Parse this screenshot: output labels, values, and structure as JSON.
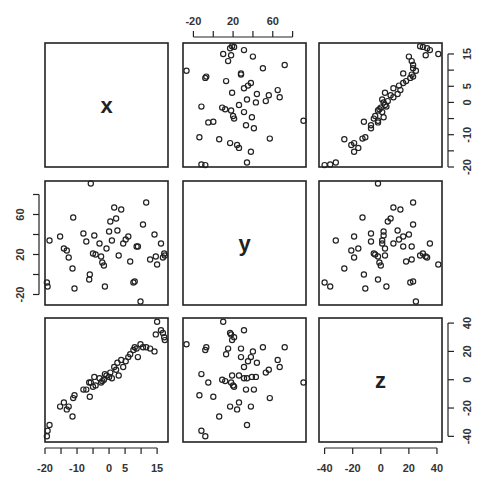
{
  "chart_data": {
    "type": "scatter",
    "subtype": "scatterplot-matrix",
    "title": "",
    "variables": [
      "x",
      "y",
      "z"
    ],
    "diagonal_labels": [
      "x",
      "y",
      "z"
    ],
    "axes": {
      "x": {
        "range": [
          -20,
          18.4
        ],
        "ticks": [
          -20,
          -15,
          -10,
          -5,
          0,
          5,
          10,
          15
        ],
        "tick_labels": [
          "-20",
          "",
          "-10",
          "",
          "0",
          "5",
          "",
          "15"
        ]
      },
      "y": {
        "range": [
          -30.5,
          93.5
        ],
        "ticks": [
          -20,
          0,
          20,
          40,
          60,
          80
        ],
        "tick_labels": [
          "-20",
          "",
          "20",
          "",
          "60",
          ""
        ]
      },
      "z": {
        "range": [
          -44,
          43.6
        ],
        "ticks": [
          -40,
          -20,
          0,
          20,
          40
        ],
        "tick_labels": [
          "-40",
          "-20",
          "0",
          "20",
          "40"
        ]
      }
    },
    "axis_placement": {
      "top": "y",
      "right": "x",
      "left": "y",
      "bottom_left": "x",
      "bottom_right": "z",
      "right_lower": "z"
    },
    "grid": false,
    "legend": "none",
    "marker": "open-circle",
    "points": [
      {
        "x": -19.4,
        "y": -8,
        "z": -40
      },
      {
        "x": -19.2,
        "y": -12,
        "z": -36
      },
      {
        "x": -18.6,
        "y": 34,
        "z": -32
      },
      {
        "x": -15.3,
        "y": 38,
        "z": -19
      },
      {
        "x": -14.1,
        "y": 26,
        "z": -16
      },
      {
        "x": -13.2,
        "y": 24,
        "z": -21
      },
      {
        "x": -12.6,
        "y": 17,
        "z": -19
      },
      {
        "x": -11.4,
        "y": 6,
        "z": -26
      },
      {
        "x": -11.2,
        "y": 57,
        "z": -13
      },
      {
        "x": -10.8,
        "y": -14,
        "z": -11
      },
      {
        "x": -8.0,
        "y": 41,
        "z": -7
      },
      {
        "x": -7.1,
        "y": 33,
        "z": -7
      },
      {
        "x": -6.2,
        "y": -5,
        "z": -2
      },
      {
        "x": -6.0,
        "y": 0,
        "z": -12
      },
      {
        "x": -5.7,
        "y": 91,
        "z": -2
      },
      {
        "x": -5.0,
        "y": 21,
        "z": -5
      },
      {
        "x": -4.6,
        "y": 39,
        "z": 2
      },
      {
        "x": -4.2,
        "y": 20,
        "z": -4
      },
      {
        "x": -3.0,
        "y": 31,
        "z": 1
      },
      {
        "x": -2.5,
        "y": 18,
        "z": -2
      },
      {
        "x": -2.1,
        "y": 12,
        "z": -1
      },
      {
        "x": -1.6,
        "y": 9,
        "z": 0
      },
      {
        "x": -1.3,
        "y": -12,
        "z": 4
      },
      {
        "x": -0.8,
        "y": 26,
        "z": 3
      },
      {
        "x": 0.0,
        "y": 43,
        "z": 2
      },
      {
        "x": 0.4,
        "y": 53,
        "z": 5
      },
      {
        "x": 0.9,
        "y": 34,
        "z": 1
      },
      {
        "x": 1.6,
        "y": 67,
        "z": 9
      },
      {
        "x": 2.2,
        "y": 56,
        "z": 7
      },
      {
        "x": 2.6,
        "y": 44,
        "z": 12
      },
      {
        "x": 3.0,
        "y": 19,
        "z": 3
      },
      {
        "x": 3.8,
        "y": 65,
        "z": 14
      },
      {
        "x": 4.4,
        "y": 31,
        "z": 9
      },
      {
        "x": 5.2,
        "y": 35,
        "z": 13
      },
      {
        "x": 6.0,
        "y": 38,
        "z": 16
      },
      {
        "x": 6.6,
        "y": 13,
        "z": 18
      },
      {
        "x": 7.6,
        "y": -8,
        "z": 21
      },
      {
        "x": 8.0,
        "y": -7,
        "z": 23
      },
      {
        "x": 8.6,
        "y": 28,
        "z": 22
      },
      {
        "x": 9.0,
        "y": 28,
        "z": 16
      },
      {
        "x": 9.8,
        "y": -27,
        "z": 25
      },
      {
        "x": 10.6,
        "y": 50,
        "z": 23
      },
      {
        "x": 11.6,
        "y": 72,
        "z": 23
      },
      {
        "x": 12.8,
        "y": 15,
        "z": 22
      },
      {
        "x": 14.2,
        "y": 40,
        "z": 20
      },
      {
        "x": 14.6,
        "y": 18,
        "z": 32
      },
      {
        "x": 15.0,
        "y": 10,
        "z": 41
      },
      {
        "x": 16.2,
        "y": 31,
        "z": 35
      },
      {
        "x": 16.8,
        "y": 17,
        "z": 33
      },
      {
        "x": 17.2,
        "y": 21,
        "z": 30
      },
      {
        "x": 17.4,
        "y": 19,
        "z": 28
      }
    ]
  }
}
